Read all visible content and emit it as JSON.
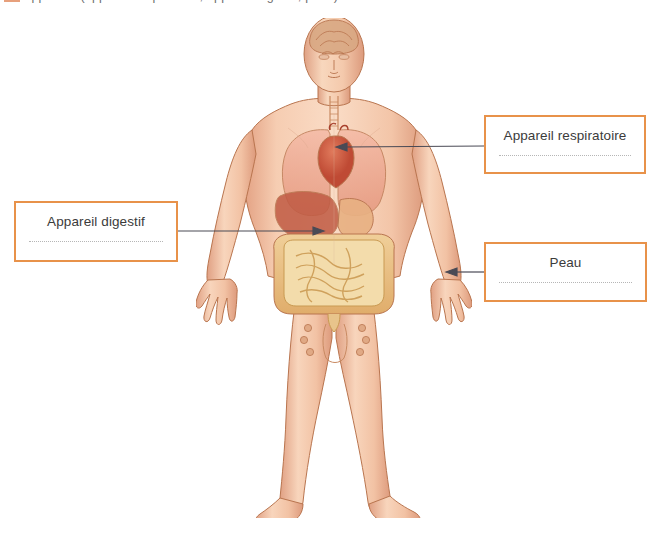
{
  "page": {
    "width": 666,
    "height": 534,
    "background": "#ffffff",
    "top_strip": {
      "visible": true,
      "note": "cut-off line of text from the page above, only descenders visible",
      "text": "les appareils (appareil respiratoire, appareil digestif, peau)",
      "swatch_color": "#e7a07c"
    }
  },
  "illustration": {
    "name": "human-anatomy-figure",
    "description": "Front-facing anatomical illustration of a standing male human body with internal organs visible",
    "organs_depicted": [
      "brain",
      "trachea",
      "lungs",
      "heart",
      "liver",
      "stomach",
      "small-intestine",
      "large-intestine",
      "lymph-nodes"
    ],
    "colors": {
      "skin": "#f2c4a8",
      "skin_shadow": "#e0a285",
      "lung": "#efa38f",
      "heart": "#d4624a",
      "liver": "#c05a43",
      "stomach": "#e8b183",
      "intestine": "#e9b96e",
      "brain": "#d9a883",
      "outline": "#b9754f"
    }
  },
  "labels": [
    {
      "id": "respiratoire",
      "caption": "Appareil respiratoire",
      "border_color": "#e8924a",
      "text_color": "#3b3b3b",
      "answer_line": true,
      "points_to": "heart-and-lungs"
    },
    {
      "id": "digestif",
      "caption": "Appareil digestif",
      "border_color": "#e8924a",
      "text_color": "#3b3b3b",
      "answer_line": true,
      "points_to": "intestines"
    },
    {
      "id": "peau",
      "caption": "Peau",
      "border_color": "#e8924a",
      "text_color": "#3b3b3b",
      "answer_line": true,
      "points_to": "right-hand-skin"
    }
  ],
  "leader_lines": [
    {
      "id": "leader-respiratoire",
      "from_x": 484,
      "from_y": 146,
      "to_x": 338,
      "to_y": 147,
      "color": "#4a4a55",
      "arrow": "left"
    },
    {
      "id": "leader-digestif",
      "from_x": 178,
      "from_y": 231,
      "to_x": 322,
      "to_y": 231,
      "color": "#4a4a55",
      "arrow": "right"
    },
    {
      "id": "leader-peau",
      "from_x": 484,
      "from_y": 272,
      "to_x": 446,
      "to_y": 272,
      "color": "#4a4a55",
      "arrow": "left"
    }
  ]
}
